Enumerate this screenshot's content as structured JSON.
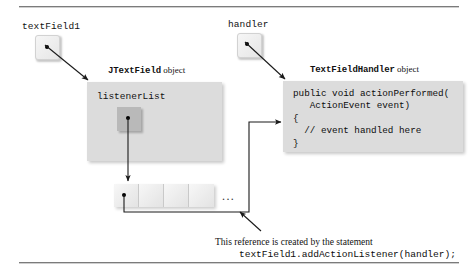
{
  "diagram": {
    "rules": {
      "top": "horizontal-rule",
      "bottom": "horizontal-rule"
    },
    "variables": [
      {
        "name": "textField1",
        "label": "textField1"
      },
      {
        "name": "handler",
        "label": "handler"
      }
    ],
    "objects": [
      {
        "name": "jtextfield-object",
        "caption_mono": "JTextField",
        "caption_plain": " object",
        "field_label": "listenerList"
      },
      {
        "name": "textfieldhandler-object",
        "caption_mono": "TextFieldHandler",
        "caption_plain": " object",
        "code_lines": [
          "public void actionPerformed(",
          "   ActionEvent event)",
          "{",
          "  // event handled here",
          "}"
        ]
      }
    ],
    "listener_array": {
      "name": "listener-array",
      "cell_count": 4,
      "ellipsis": "..."
    },
    "note": {
      "line1": "This reference is created by the statement",
      "line2": "textField1.addActionListener(handler);"
    },
    "colors": {
      "object_fill": "#dcdcdc",
      "ref_box_fill": "#ededed",
      "inner_ref_fill": "#b9b9b9",
      "line": "#1a1a1a",
      "rule": "#7b7b7b",
      "text": "#111111"
    }
  }
}
